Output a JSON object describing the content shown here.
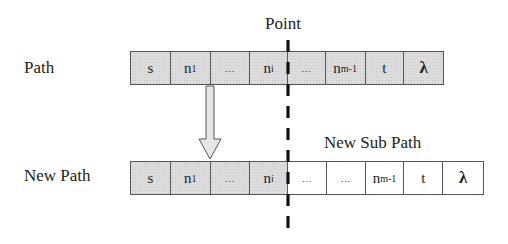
{
  "diagram": {
    "point_label": "Point",
    "sub_path_label": "New Sub Path",
    "rows": [
      {
        "label": "Path",
        "cells": [
          {
            "base": "s",
            "sub": "",
            "fill": "gray"
          },
          {
            "base": "n",
            "sub": "1",
            "fill": "gray"
          },
          {
            "base": "...",
            "sub": "",
            "fill": "gray"
          },
          {
            "base": "n",
            "sub": "i",
            "fill": "gray"
          },
          {
            "base": "...",
            "sub": "",
            "fill": "gray"
          },
          {
            "base": "n",
            "sub": "m-1",
            "fill": "gray"
          },
          {
            "base": "t",
            "sub": "",
            "fill": "gray"
          },
          {
            "base": "λ",
            "sub": "",
            "fill": "gray"
          }
        ]
      },
      {
        "label": "New Path",
        "cells": [
          {
            "base": "s",
            "sub": "",
            "fill": "gray"
          },
          {
            "base": "n",
            "sub": "1",
            "fill": "gray"
          },
          {
            "base": "...",
            "sub": "",
            "fill": "gray"
          },
          {
            "base": "n",
            "sub": "i",
            "fill": "gray"
          },
          {
            "base": "...",
            "sub": "",
            "fill": "white"
          },
          {
            "base": "...",
            "sub": "",
            "fill": "white"
          },
          {
            "base": "n",
            "sub": "m-1",
            "fill": "white"
          },
          {
            "base": "t",
            "sub": "",
            "fill": "white"
          },
          {
            "base": "λ",
            "sub": "",
            "fill": "white"
          }
        ]
      }
    ],
    "colors": {
      "gray_fill": "#dcdcdc",
      "border": "#555555",
      "dashed_line": "#111111",
      "arrow_fill": "#e6e6e6"
    }
  }
}
